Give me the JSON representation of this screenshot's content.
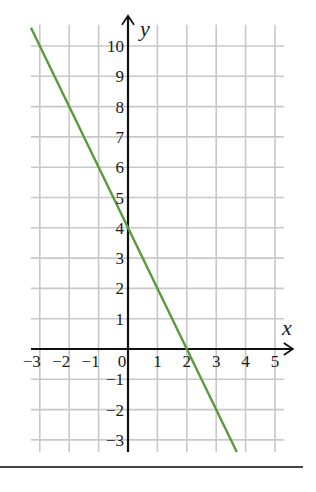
{
  "chart_data": {
    "type": "line",
    "title": "",
    "xlabel": "x",
    "ylabel": "y",
    "xlim": [
      -3.3,
      5.3
    ],
    "ylim": [
      -3.4,
      10.7
    ],
    "grid": true,
    "x_ticks": [
      -3,
      -2,
      -1,
      0,
      1,
      2,
      3,
      4,
      5
    ],
    "y_ticks": [
      -3,
      -2,
      -1,
      1,
      2,
      3,
      4,
      5,
      6,
      7,
      8,
      9,
      10
    ],
    "x_tick_labels": [
      "−3",
      "−2",
      "−1",
      "0",
      "1",
      "2",
      "3",
      "4",
      "5"
    ],
    "y_tick_labels": [
      "−3",
      "−2",
      "−1",
      "1",
      "2",
      "3",
      "4",
      "5",
      "6",
      "7",
      "8",
      "9",
      "10"
    ],
    "series": [
      {
        "name": "y = -2x + 4",
        "color": "#5a9a3c",
        "x": [
          -3.3,
          3.7
        ],
        "y": [
          10.6,
          -3.4
        ]
      }
    ],
    "key_points": [
      {
        "x": 0,
        "y": 4,
        "label": "y-intercept"
      },
      {
        "x": 2,
        "y": 0,
        "label": "x-intercept"
      }
    ]
  },
  "colors": {
    "grid": "#c8c8c8",
    "axis": "#111111",
    "line": "#5a9a3c"
  }
}
